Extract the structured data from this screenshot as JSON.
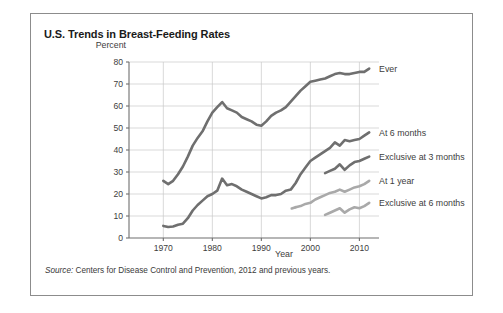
{
  "figure": {
    "title": "U.S. Trends in Breast-Feeding Rates",
    "source_label": "Source:",
    "source_text": "Centers for Disease Control and Prevention, 2012 and previous years."
  },
  "colors": {
    "dark_series": "#6f6f6f",
    "light_series": "#a9a9a9",
    "gridline": "#c9c9c9",
    "axis": "#6f6f6f",
    "text": "#3d3d3d",
    "frame": "#8c8c8c",
    "background": "#ffffff"
  },
  "chart_data": {
    "type": "line",
    "title": "U.S. Trends in Breast-Feeding Rates",
    "xlabel": "Year",
    "ylabel": "Percent",
    "xlim": [
      1963,
      2014
    ],
    "ylim": [
      0,
      80
    ],
    "xticks": [
      1970,
      1980,
      1990,
      2000,
      2010
    ],
    "yticks": [
      0,
      10,
      20,
      30,
      40,
      50,
      60,
      70,
      80
    ],
    "grid": "horizontal-and-vertical",
    "legend_position": "right-of-line-ends",
    "series": [
      {
        "name": "Ever",
        "color": "#6f6f6f",
        "x": [
          1970,
          1971,
          1972,
          1973,
          1974,
          1975,
          1976,
          1977,
          1978,
          1979,
          1980,
          1981,
          1982,
          1983,
          1984,
          1985,
          1986,
          1987,
          1988,
          1989,
          1990,
          1991,
          1992,
          1993,
          1994,
          1995,
          1996,
          1997,
          1998,
          1999,
          2000,
          2001,
          2002,
          2003,
          2004,
          2005,
          2006,
          2007,
          2008,
          2009,
          2010,
          2011,
          2012
        ],
        "values": [
          26.0,
          24.5,
          26.0,
          29.0,
          32.5,
          37.0,
          42.0,
          45.5,
          48.5,
          53.0,
          57.0,
          59.5,
          61.8,
          59.0,
          58.0,
          57.0,
          55.0,
          54.0,
          53.0,
          51.5,
          51.0,
          53.0,
          55.5,
          57.0,
          58.0,
          59.5,
          62.0,
          64.5,
          67.0,
          69.0,
          71.0,
          71.5,
          72.0,
          72.5,
          73.5,
          74.5,
          75.0,
          74.5,
          74.5,
          75.0,
          75.5,
          75.5,
          77.0
        ]
      },
      {
        "name": "At 6 months",
        "color": "#6f6f6f",
        "x": [
          1970,
          1971,
          1972,
          1973,
          1974,
          1975,
          1976,
          1977,
          1978,
          1979,
          1980,
          1981,
          1982,
          1983,
          1984,
          1985,
          1986,
          1987,
          1988,
          1989,
          1990,
          1991,
          1992,
          1993,
          1994,
          1995,
          1996,
          1997,
          1998,
          1999,
          2000,
          2001,
          2002,
          2003,
          2004,
          2005,
          2006,
          2007,
          2008,
          2009,
          2010,
          2011,
          2012
        ],
        "values": [
          5.5,
          5.0,
          5.2,
          6.0,
          6.5,
          9.0,
          12.5,
          15.0,
          17.0,
          19.0,
          20.0,
          21.5,
          27.0,
          24.0,
          24.5,
          23.5,
          22.0,
          21.0,
          20.0,
          19.0,
          18.0,
          18.5,
          19.5,
          19.5,
          20.0,
          21.5,
          22.0,
          25.0,
          29.0,
          32.0,
          35.0,
          36.5,
          38.0,
          39.5,
          41.0,
          43.5,
          42.0,
          44.5,
          44.0,
          44.5,
          45.0,
          46.5,
          48.0
        ]
      },
      {
        "name": "Exclusive at 3 months",
        "color": "#6f6f6f",
        "x": [
          2003,
          2004,
          2005,
          2006,
          2007,
          2008,
          2009,
          2010,
          2011,
          2012
        ],
        "values": [
          29.5,
          30.5,
          31.5,
          33.5,
          31.0,
          33.0,
          34.5,
          35.0,
          36.0,
          37.0
        ]
      },
      {
        "name": "At 1 year",
        "color": "#a9a9a9",
        "x": [
          1997,
          1998,
          1999,
          2000,
          2001,
          2002,
          2003,
          2004,
          2005,
          2006,
          2007,
          2008,
          2009,
          2010,
          2011,
          2012
        ],
        "values": [
          14.0,
          14.5,
          15.5,
          16.0,
          17.5,
          18.5,
          19.5,
          20.5,
          21.0,
          22.0,
          21.0,
          22.0,
          23.0,
          23.5,
          24.5,
          26.0
        ]
      },
      {
        "name": "Exclusive at 6 months",
        "color": "#a9a9a9",
        "x": [
          2003,
          2004,
          2005,
          2006,
          2007,
          2008,
          2009,
          2010,
          2011,
          2012
        ],
        "values": [
          10.5,
          11.5,
          12.5,
          13.5,
          11.5,
          13.0,
          14.0,
          13.5,
          14.5,
          16.0
        ]
      }
    ],
    "annotations": [
      {
        "text": "Ever",
        "x": 2013,
        "y": 77
      },
      {
        "text": "At 6 months",
        "x": 2013,
        "y": 48
      },
      {
        "text": "Exclusive at 3 months",
        "x": 2013,
        "y": 37
      },
      {
        "text": "At 1 year",
        "x": 2013,
        "y": 26
      },
      {
        "text": "Exclusive at 6 months",
        "x": 2013,
        "y": 16
      }
    ]
  }
}
